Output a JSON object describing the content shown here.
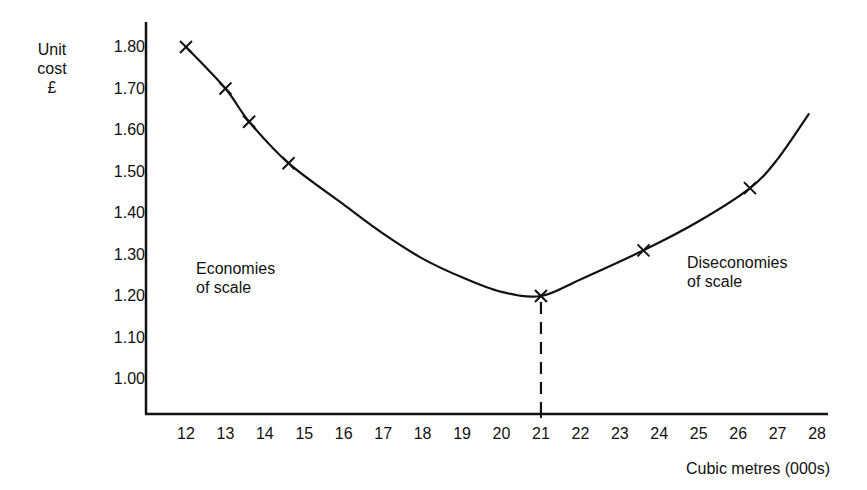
{
  "chart_data": {
    "type": "line",
    "title": "",
    "xlabel": "Cubic metres (000s)",
    "ylabel": "Unit cost £",
    "ylabel_lines": [
      "Unit",
      "cost",
      "£"
    ],
    "xlim": [
      11,
      28.3
    ],
    "ylim": [
      0.9,
      1.9
    ],
    "x_ticks": [
      12,
      13,
      14,
      15,
      16,
      17,
      18,
      19,
      20,
      21,
      22,
      23,
      24,
      25,
      26,
      27,
      28
    ],
    "y_ticks": [
      "1.00",
      "1.10",
      "1.20",
      "1.30",
      "1.40",
      "1.50",
      "1.60",
      "1.70",
      "1.80"
    ],
    "grid": false,
    "legend": null,
    "series": [
      {
        "name": "Unit cost curve",
        "marked_points": [
          {
            "x": 12.0,
            "y": 1.8
          },
          {
            "x": 13.0,
            "y": 1.7
          },
          {
            "x": 13.6,
            "y": 1.62
          },
          {
            "x": 14.6,
            "y": 1.52
          },
          {
            "x": 21.0,
            "y": 1.2
          },
          {
            "x": 23.6,
            "y": 1.31
          },
          {
            "x": 26.3,
            "y": 1.46
          }
        ],
        "curve_points": [
          {
            "x": 12.0,
            "y": 1.8
          },
          {
            "x": 13.0,
            "y": 1.7
          },
          {
            "x": 13.6,
            "y": 1.62
          },
          {
            "x": 14.6,
            "y": 1.52
          },
          {
            "x": 16.0,
            "y": 1.42
          },
          {
            "x": 17.0,
            "y": 1.35
          },
          {
            "x": 18.0,
            "y": 1.29
          },
          {
            "x": 19.0,
            "y": 1.245
          },
          {
            "x": 20.0,
            "y": 1.21
          },
          {
            "x": 21.0,
            "y": 1.2
          },
          {
            "x": 22.0,
            "y": 1.24
          },
          {
            "x": 23.6,
            "y": 1.31
          },
          {
            "x": 25.0,
            "y": 1.38
          },
          {
            "x": 26.3,
            "y": 1.46
          },
          {
            "x": 27.0,
            "y": 1.53
          },
          {
            "x": 27.8,
            "y": 1.64
          }
        ],
        "marker": "x",
        "color": "#111111"
      }
    ],
    "reference_lines": [
      {
        "type": "vertical-dashed",
        "x": 21,
        "from_y": 1.2,
        "to": "x-axis"
      }
    ],
    "annotations": [
      {
        "text": "Economies of scale",
        "lines": [
          "Economies",
          "of scale"
        ],
        "region": "left"
      },
      {
        "text": "Diseconomies of scale",
        "lines": [
          "Diseconomies",
          "of scale"
        ],
        "region": "right"
      }
    ],
    "minimum_point": {
      "x": 21,
      "y": 1.2
    }
  },
  "labels": {
    "ylabel_1": "Unit",
    "ylabel_2": "cost",
    "ylabel_3": "£",
    "xlabel": "Cubic metres (000s)",
    "econ_1": "Economies",
    "econ_2": "of scale",
    "disecon_1": "Diseconomies",
    "disecon_2": "of scale"
  }
}
